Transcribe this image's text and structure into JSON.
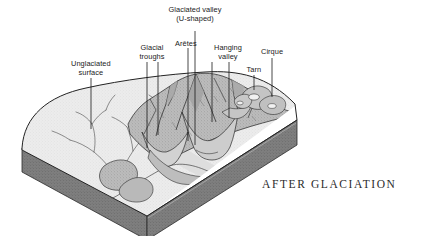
{
  "figure": {
    "caption": "AFTER GLACIATION",
    "kind": "block-diagram"
  },
  "labels": [
    {
      "id": "unglaciated-surface",
      "text": "Unglaciated\nsurface",
      "x": 91,
      "y": 60,
      "leader": {
        "x1": 91,
        "y1": 78,
        "x2": 91,
        "y2": 129
      }
    },
    {
      "id": "glacial-troughs",
      "text": "Glacial\ntroughs",
      "x": 152,
      "y": 44,
      "leader": {
        "x1": 147,
        "y1": 62,
        "x2": 147,
        "y2": 148
      }
    },
    {
      "id": "glacial-troughs-2",
      "text": "",
      "x": 0,
      "y": 0,
      "leader": {
        "x1": 158,
        "y1": 62,
        "x2": 158,
        "y2": 135
      }
    },
    {
      "id": "aretes",
      "text": "Arêtes",
      "x": 186,
      "y": 40,
      "leader": {
        "x1": 188,
        "y1": 48,
        "x2": 188,
        "y2": 141
      }
    },
    {
      "id": "glaciated-valley",
      "text": "Glaciated valley\n(U-shaped)",
      "x": 195,
      "y": 6,
      "leader": {
        "x1": 195,
        "y1": 31,
        "x2": 195,
        "y2": 145
      }
    },
    {
      "id": "hanging-valley",
      "text": "Hanging\nvalley",
      "x": 228,
      "y": 44,
      "leader": {
        "x1": 212,
        "y1": 62,
        "x2": 212,
        "y2": 122
      }
    },
    {
      "id": "hanging-valley-2",
      "text": "",
      "x": 0,
      "y": 0,
      "leader": {
        "x1": 229,
        "y1": 62,
        "x2": 229,
        "y2": 118
      }
    },
    {
      "id": "tarn",
      "text": "Tarn",
      "x": 254,
      "y": 66,
      "leader": {
        "x1": 254,
        "y1": 75,
        "x2": 254,
        "y2": 90
      }
    },
    {
      "id": "cirque",
      "text": "Cirque",
      "x": 272,
      "y": 48,
      "leader": {
        "x1": 272,
        "y1": 58,
        "x2": 272,
        "y2": 97
      }
    }
  ],
  "palette": {
    "ink": "#1a1a1a",
    "caption_ink": "#2b2b2b",
    "smooth_surface": "#e7e7e7",
    "mountain_mass": "#b4b4b4",
    "mountain_shadow": "#8e8e8e",
    "slab_side": "#7c7c7c",
    "slab_front": "#8a8a8a",
    "valley_floor": "#dcdcdc",
    "background": "#ffffff"
  }
}
